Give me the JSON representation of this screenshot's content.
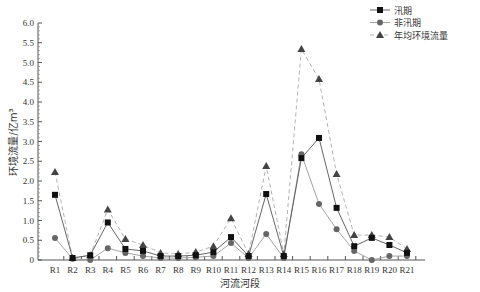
{
  "chart_data": {
    "type": "line",
    "title": "",
    "xlabel": "河流河段",
    "ylabel": "环境流量/亿m³",
    "ylim": [
      0,
      6.0
    ],
    "yticks": [
      "0",
      "0.5",
      "1.0",
      "1.5",
      "2.0",
      "2.5",
      "3.0",
      "3.5",
      "4.0",
      "4.5",
      "5.0",
      "5.5",
      "6.0"
    ],
    "grid": false,
    "legend_position": "top-right",
    "categories": [
      "R1",
      "R2",
      "R3",
      "R4",
      "R5",
      "R6",
      "R7",
      "R8",
      "R9",
      "R10",
      "R11",
      "R12",
      "R13",
      "R14",
      "R15",
      "R16",
      "R17",
      "R18",
      "R19",
      "R20",
      "R21"
    ],
    "series": [
      {
        "name": "汛期",
        "marker": "square",
        "color": "#111111",
        "line_color": "#555555",
        "dash": "",
        "values": [
          1.65,
          0.05,
          0.12,
          0.95,
          0.28,
          0.23,
          0.1,
          0.1,
          0.12,
          0.2,
          0.58,
          0.1,
          1.67,
          0.1,
          2.58,
          3.09,
          1.32,
          0.35,
          0.56,
          0.38,
          0.18
        ]
      },
      {
        "name": "非汛期",
        "marker": "circle",
        "color": "#666666",
        "line_color": "#999999",
        "dash": "",
        "values": [
          0.56,
          0.03,
          0.0,
          0.3,
          0.18,
          0.1,
          0.05,
          0.05,
          0.07,
          0.1,
          0.43,
          0.05,
          0.66,
          0.05,
          2.68,
          1.42,
          0.78,
          0.23,
          0.0,
          0.1,
          0.1
        ]
      },
      {
        "name": "年均环境流量",
        "marker": "triangle",
        "color": "#444444",
        "line_color": "#aaaaaa",
        "dash": "4,3",
        "values": [
          2.23,
          0.05,
          0.12,
          1.28,
          0.53,
          0.38,
          0.18,
          0.15,
          0.2,
          0.35,
          1.06,
          0.15,
          2.38,
          0.15,
          5.34,
          4.58,
          2.18,
          0.63,
          0.63,
          0.58,
          0.28
        ]
      }
    ]
  },
  "legend": {
    "items": [
      "汛期",
      "非汛期",
      "年均环境流量"
    ]
  }
}
